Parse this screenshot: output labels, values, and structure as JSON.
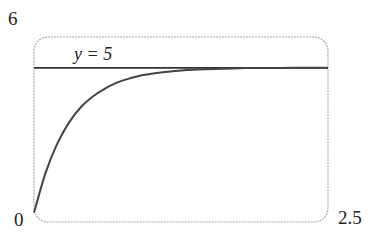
{
  "chart_data": {
    "type": "line",
    "title": "",
    "xlabel": "",
    "ylabel": "",
    "xlim": [
      0,
      2.5
    ],
    "ylim": [
      0,
      6
    ],
    "x_tick_labels": [
      "0",
      "2.5"
    ],
    "y_tick_labels": [
      "6"
    ],
    "grid": false,
    "legend": null,
    "annotations": [
      {
        "text": "y = 5",
        "type": "horizontal_asymptote",
        "y": 5
      }
    ],
    "series": [
      {
        "name": "curve",
        "x": [
          0,
          0.1,
          0.2,
          0.3,
          0.4,
          0.5,
          0.6,
          0.7,
          0.8,
          0.9,
          1.0,
          1.2,
          1.4,
          1.6,
          1.8,
          2.0,
          2.2,
          2.5
        ],
        "values": [
          0.3,
          1.62,
          2.56,
          3.24,
          3.73,
          4.07,
          4.32,
          4.51,
          4.64,
          4.74,
          4.81,
          4.9,
          4.95,
          4.97,
          4.99,
          4.99,
          5.0,
          5.0
        ]
      },
      {
        "name": "y = 5",
        "x": [
          0,
          2.5
        ],
        "values": [
          5,
          5
        ]
      }
    ]
  },
  "labels": {
    "y_max": "6",
    "origin": "0",
    "x_max": "2.5",
    "asymptote": "y = 5"
  }
}
